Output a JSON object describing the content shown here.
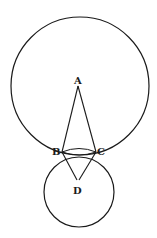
{
  "diagram": {
    "type": "geometry",
    "stroke_color": "#1a1a1a",
    "background": "#ffffff",
    "circles": [
      {
        "id": "outer",
        "cx": 80,
        "cy": 86,
        "r": 69
      },
      {
        "id": "inner",
        "cx": 79,
        "cy": 192,
        "r": 35
      }
    ],
    "points": {
      "A": {
        "label": "A",
        "x": 78,
        "y": 82
      },
      "B": {
        "label": "B",
        "x": 62,
        "y": 152
      },
      "C": {
        "label": "C",
        "x": 96,
        "y": 152
      },
      "D": {
        "label": "D",
        "x": 78,
        "y": 190
      }
    },
    "segments": [
      [
        "A",
        "B"
      ],
      [
        "A",
        "C"
      ],
      [
        "B",
        "D"
      ],
      [
        "C",
        "D"
      ],
      [
        "B",
        "C"
      ]
    ],
    "labels": {
      "A": "A",
      "B": "B",
      "C": "C",
      "D": "D"
    }
  }
}
